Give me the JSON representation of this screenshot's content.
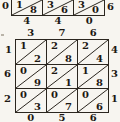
{
  "colors": {
    "paper": "#f7f5f0",
    "ink": "#1c1813",
    "line": "#2b261f"
  },
  "top_lattice": {
    "left_label": "0",
    "right_label": "6",
    "bottom_labels": [
      "4",
      "4",
      "0"
    ],
    "cells": [
      {
        "tens": "1",
        "units": "8"
      },
      {
        "tens": "3",
        "units": "6"
      },
      {
        "tens": "3",
        "units": "0"
      }
    ]
  },
  "bottom_lattice": {
    "top_labels": [
      "3",
      "7",
      "6"
    ],
    "right_labels": [
      "4",
      "3",
      "1"
    ],
    "left_labels": [
      "1",
      "6",
      "2"
    ],
    "bottom_labels": [
      "0",
      "5",
      "6"
    ],
    "rows": [
      [
        {
          "tens": "1",
          "units": "2"
        },
        {
          "tens": "2",
          "units": "8"
        },
        {
          "tens": "2",
          "units": "4"
        }
      ],
      [
        {
          "tens": "0",
          "units": "9"
        },
        {
          "tens": "2",
          "units": "1"
        },
        {
          "tens": "1",
          "units": "8"
        }
      ],
      [
        {
          "tens": "0",
          "units": "3"
        },
        {
          "tens": "0",
          "units": "7"
        },
        {
          "tens": "0",
          "units": "6"
        }
      ]
    ]
  }
}
